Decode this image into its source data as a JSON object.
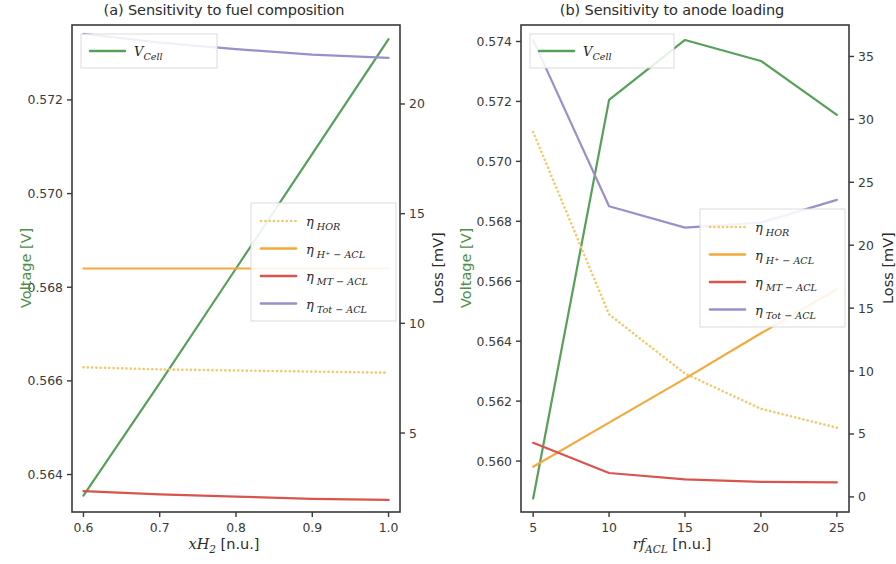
{
  "figure": {
    "width": 896,
    "height": 564,
    "background": "#ffffff"
  },
  "colors": {
    "v_cell": "#57a05a",
    "eta_hor": "#f3c96b",
    "eta_h_acl": "#f5a93c",
    "eta_mt_acl": "#d9544d",
    "eta_tot_acl": "#9b8fc9",
    "axis": "#3a3a3a",
    "text": "#2b2b2b",
    "left_axis_label": "#4f8f47"
  },
  "legend_labels": {
    "v_cell": "V",
    "v_cell_sub": "Cell",
    "eta": "η",
    "eta_hor_sub": "HOR",
    "eta_h_acl_sub": "H⁺ − ACL",
    "eta_mt_acl_sub": "MT − ACL",
    "eta_tot_acl_sub": "Tot − ACL"
  },
  "panel_a": {
    "title": "(a) Sensitivity to fuel composition",
    "xlabel_main": "xH",
    "xlabel_sub": "2",
    "xlabel_unit": " [n.u.]",
    "ylabel_left": "Voltage [V]",
    "ylabel_right": "Loss [mV]"
  },
  "panel_b": {
    "title": "(b) Sensitivity to anode loading",
    "xlabel_main": "rf",
    "xlabel_sub": "ACL",
    "xlabel_unit": " [n.u.]",
    "ylabel_left": "Voltage [V]",
    "ylabel_right": "Loss [mV]"
  },
  "chart_data": [
    {
      "type": "line",
      "panel": "a",
      "title": "(a) Sensitivity to fuel composition",
      "xlabel": "xH2 [n.u.]",
      "ylabel": "Voltage [V]",
      "ylabel_right": "Loss [mV]",
      "xlim": [
        0.585,
        1.015
      ],
      "xticks": [
        0.6,
        0.7,
        0.8,
        0.9,
        1.0
      ],
      "xticklabels": [
        "0.6",
        "0.7",
        "0.8",
        "0.9",
        "1.0"
      ],
      "ylim_left": [
        0.5632,
        0.5736
      ],
      "yticks_left": [
        0.564,
        0.566,
        0.568,
        0.57,
        0.572
      ],
      "yticklabels_left": [
        "0.564",
        "0.566",
        "0.568",
        "0.570",
        "0.572"
      ],
      "ylim_right": [
        1.4,
        23.6
      ],
      "yticks_right": [
        5,
        10,
        15,
        20
      ],
      "yticklabels_right": [
        "5",
        "10",
        "15",
        "20"
      ],
      "grid": false,
      "legend_position": "center-right",
      "series": [
        {
          "name": "V_Cell",
          "axis": "left",
          "style": "solid",
          "color": "#57a05a",
          "x": [
            0.6,
            0.7,
            0.8,
            0.9,
            1.0
          ],
          "values": [
            0.56355,
            0.56595,
            0.5684,
            0.57085,
            0.5733
          ]
        },
        {
          "name": "eta_HOR",
          "axis": "right",
          "style": "dotted",
          "color": "#f3c96b",
          "x": [
            0.6,
            0.7,
            0.8,
            0.9,
            1.0
          ],
          "values": [
            8.0,
            7.9,
            7.85,
            7.8,
            7.75
          ]
        },
        {
          "name": "eta_H+-ACL",
          "axis": "right",
          "style": "solid",
          "color": "#f5a93c",
          "x": [
            0.6,
            0.7,
            0.8,
            0.9,
            1.0
          ],
          "values": [
            12.5,
            12.5,
            12.5,
            12.5,
            12.5
          ]
        },
        {
          "name": "eta_MT-ACL",
          "axis": "right",
          "style": "solid",
          "color": "#d9544d",
          "x": [
            0.6,
            0.7,
            0.8,
            0.9,
            1.0
          ],
          "values": [
            2.35,
            2.2,
            2.1,
            2.0,
            1.95
          ]
        },
        {
          "name": "eta_Tot-ACL",
          "axis": "right",
          "style": "solid",
          "color": "#9b8fc9",
          "x": [
            0.6,
            0.7,
            0.8,
            0.9,
            1.0
          ],
          "values": [
            23.2,
            22.8,
            22.5,
            22.25,
            22.1
          ]
        }
      ]
    },
    {
      "type": "line",
      "panel": "b",
      "title": "(b) Sensitivity to anode loading",
      "xlabel": "rfACL [n.u.]",
      "ylabel": "Voltage [V]",
      "ylabel_right": "Loss [mV]",
      "xlim": [
        4.2,
        25.8
      ],
      "xticks": [
        5,
        10,
        15,
        20,
        25
      ],
      "xticklabels": [
        "5",
        "10",
        "15",
        "20",
        "25"
      ],
      "ylim_left": [
        0.5583,
        0.57455
      ],
      "yticks_left": [
        0.56,
        0.562,
        0.564,
        0.566,
        0.568,
        0.57,
        0.572,
        0.574
      ],
      "yticklabels_left": [
        "0.560",
        "0.562",
        "0.564",
        "0.566",
        "0.568",
        "0.570",
        "0.572",
        "0.574"
      ],
      "ylim_right": [
        -1.2,
        37.5
      ],
      "yticks_right": [
        0,
        5,
        10,
        15,
        20,
        25,
        30,
        35
      ],
      "yticklabels_right": [
        "0",
        "5",
        "10",
        "15",
        "20",
        "25",
        "30",
        "35"
      ],
      "grid": false,
      "legend_position": "center-right",
      "series": [
        {
          "name": "V_Cell",
          "axis": "left",
          "style": "solid",
          "color": "#57a05a",
          "x": [
            5,
            10,
            15,
            20,
            25
          ],
          "values": [
            0.55875,
            0.57205,
            0.57405,
            0.57335,
            0.57155
          ]
        },
        {
          "name": "eta_HOR",
          "axis": "right",
          "style": "dotted",
          "color": "#f3c96b",
          "x": [
            5,
            10,
            15,
            20,
            25
          ],
          "values": [
            29.0,
            14.5,
            9.8,
            7.0,
            5.5
          ]
        },
        {
          "name": "eta_H+-ACL",
          "axis": "right",
          "style": "solid",
          "color": "#f5a93c",
          "x": [
            5,
            10,
            15,
            20,
            25
          ],
          "values": [
            2.4,
            5.9,
            9.4,
            13.0,
            16.5
          ]
        },
        {
          "name": "eta_MT-ACL",
          "axis": "right",
          "style": "solid",
          "color": "#d9544d",
          "x": [
            5,
            10,
            15,
            20,
            25
          ],
          "values": [
            4.3,
            1.9,
            1.4,
            1.2,
            1.15
          ]
        },
        {
          "name": "eta_Tot-ACL",
          "axis": "right",
          "style": "solid",
          "color": "#9b8fc9",
          "x": [
            5,
            10,
            15,
            20,
            25
          ],
          "values": [
            36.3,
            23.1,
            21.4,
            21.8,
            23.6
          ]
        }
      ]
    }
  ]
}
